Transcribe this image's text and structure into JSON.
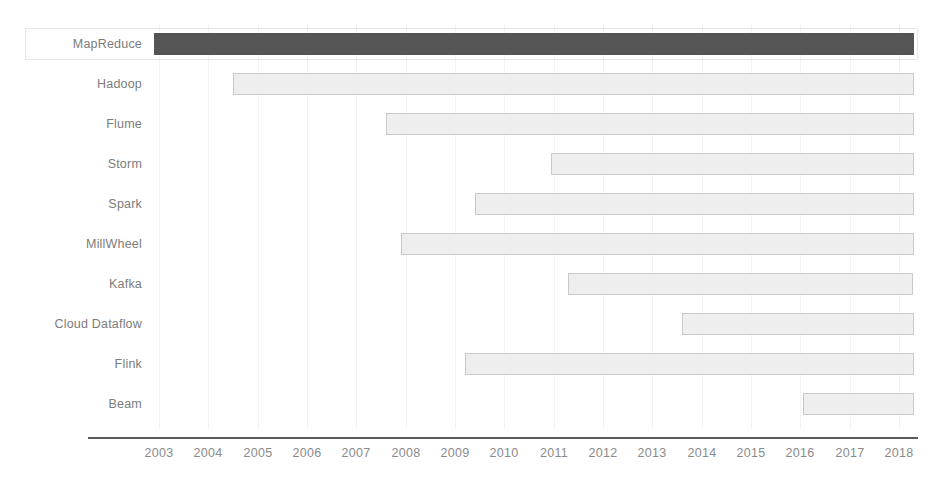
{
  "chart_data": {
    "type": "bar",
    "subtype": "gantt-timeline",
    "title": "",
    "xlabel": "",
    "ylabel": "",
    "orientation": "horizontal",
    "grid": true,
    "legend": null,
    "xlim": [
      2002.6,
      2018.6
    ],
    "xticks": [
      2003,
      2004,
      2005,
      2006,
      2007,
      2008,
      2009,
      2010,
      2011,
      2012,
      2013,
      2014,
      2015,
      2016,
      2017,
      2018
    ],
    "xtick_labels": [
      "2003",
      "2004",
      "2005",
      "2006",
      "2007",
      "2008",
      "2009",
      "2010",
      "2011",
      "2012",
      "2013",
      "2014",
      "2015",
      "2016",
      "2017",
      "2018"
    ],
    "categories": [
      "MapReduce",
      "Hadoop",
      "Flume",
      "Storm",
      "Spark",
      "MillWheel",
      "Kafka",
      "Cloud Dataflow",
      "Flink",
      "Beam"
    ],
    "bars": [
      {
        "label": "MapReduce",
        "start": 2002.9,
        "end": 2018.3,
        "highlighted": true,
        "color": "#555555"
      },
      {
        "label": "Hadoop",
        "start": 2004.5,
        "end": 2018.3,
        "highlighted": false,
        "color": "#eeeeee"
      },
      {
        "label": "Flume",
        "start": 2007.6,
        "end": 2018.3,
        "highlighted": false,
        "color": "#eeeeee"
      },
      {
        "label": "Storm",
        "start": 2010.95,
        "end": 2018.3,
        "highlighted": false,
        "color": "#eeeeee"
      },
      {
        "label": "Spark",
        "start": 2009.4,
        "end": 2018.3,
        "highlighted": false,
        "color": "#eeeeee"
      },
      {
        "label": "MillWheel",
        "start": 2007.9,
        "end": 2018.3,
        "highlighted": false,
        "color": "#eeeeee"
      },
      {
        "label": "Kafka",
        "start": 2011.3,
        "end": 2018.3,
        "highlighted": false,
        "color": "#eeeeee"
      },
      {
        "label": "Cloud Dataflow",
        "start": 2013.6,
        "end": 2018.3,
        "highlighted": false,
        "color": "#eeeeee"
      },
      {
        "label": "Flink",
        "start": 2009.2,
        "end": 2018.3,
        "highlighted": false,
        "color": "#eeeeee"
      },
      {
        "label": "Beam",
        "start": 2016.05,
        "end": 2018.3,
        "highlighted": false,
        "color": "#eeeeee"
      }
    ]
  },
  "style": {
    "bar_fill": "#eeeeee",
    "bar_stroke": "#c9c9c9",
    "highlight_fill": "#555555",
    "grid_color": "#f2f2f2",
    "axis_color": "#5a5a5a",
    "text_color": "#7c7c7c",
    "background": "#ffffff",
    "selection_border": "#e6e6e6"
  },
  "geometry": {
    "x_2003": 159,
    "px_per_year": 49.33,
    "row_top": 24,
    "row_height": 40,
    "label_right_edge": 142,
    "axis_y": 437,
    "axis_left": 88,
    "axis_right": 918,
    "tick_label_y": 446
  }
}
